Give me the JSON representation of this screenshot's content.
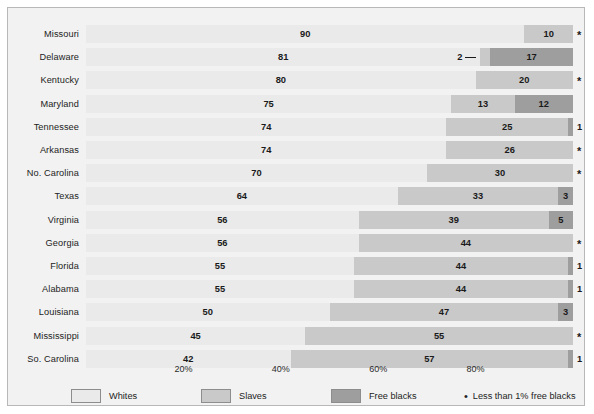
{
  "chart_data": {
    "type": "bar",
    "orientation": "horizontal",
    "stacked": true,
    "title": "",
    "xlabel": "",
    "ylabel": "",
    "xlim": [
      0,
      100
    ],
    "grid": false,
    "legend_position": "bottom",
    "xticks": [
      "20%",
      "40%",
      "60%",
      "80%"
    ],
    "xtick_values": [
      20,
      40,
      60,
      80
    ],
    "categories": [
      "Missouri",
      "Delaware",
      "Kentucky",
      "Maryland",
      "Tennessee",
      "Arkansas",
      "No. Carolina",
      "Texas",
      "Virginia",
      "Georgia",
      "Florida",
      "Alabama",
      "Louisiana",
      "Mississippi",
      "So. Carolina"
    ],
    "series": [
      {
        "name": "Whites",
        "color": "#eaeaea",
        "values": [
          90,
          81,
          80,
          75,
          74,
          74,
          70,
          64,
          56,
          56,
          55,
          55,
          50,
          45,
          42
        ]
      },
      {
        "name": "Slaves",
        "color": "#c9c9c9",
        "values": [
          10,
          2,
          20,
          13,
          25,
          26,
          30,
          33,
          39,
          44,
          44,
          44,
          47,
          55,
          57
        ]
      },
      {
        "name": "Free blacks",
        "color": "#9e9e9e",
        "values": [
          0,
          17,
          0,
          12,
          1,
          0,
          0,
          3,
          5,
          0,
          1,
          1,
          3,
          0,
          1
        ]
      }
    ],
    "rows": [
      {
        "state": "Missouri",
        "whites": 90,
        "slaves": 10,
        "free": 0,
        "whites_label": "90",
        "slaves_label": "10",
        "free_label": "",
        "end_label": "*",
        "end_is_star": true,
        "leader": false
      },
      {
        "state": "Delaware",
        "whites": 81,
        "slaves": 2,
        "free": 17,
        "whites_label": "81",
        "slaves_label": "2",
        "free_label": "17",
        "end_label": "",
        "end_is_star": false,
        "leader": true
      },
      {
        "state": "Kentucky",
        "whites": 80,
        "slaves": 20,
        "free": 0,
        "whites_label": "80",
        "slaves_label": "20",
        "free_label": "",
        "end_label": "*",
        "end_is_star": true,
        "leader": false
      },
      {
        "state": "Maryland",
        "whites": 75,
        "slaves": 13,
        "free": 12,
        "whites_label": "75",
        "slaves_label": "13",
        "free_label": "12",
        "end_label": "",
        "end_is_star": false,
        "leader": false
      },
      {
        "state": "Tennessee",
        "whites": 74,
        "slaves": 25,
        "free": 1,
        "whites_label": "74",
        "slaves_label": "25",
        "free_label": "",
        "end_label": "1",
        "end_is_star": false,
        "leader": false
      },
      {
        "state": "Arkansas",
        "whites": 74,
        "slaves": 26,
        "free": 0,
        "whites_label": "74",
        "slaves_label": "26",
        "free_label": "",
        "end_label": "*",
        "end_is_star": true,
        "leader": false
      },
      {
        "state": "No. Carolina",
        "whites": 70,
        "slaves": 30,
        "free": 0,
        "whites_label": "70",
        "slaves_label": "30",
        "free_label": "",
        "end_label": "*",
        "end_is_star": true,
        "leader": false
      },
      {
        "state": "Texas",
        "whites": 64,
        "slaves": 33,
        "free": 3,
        "whites_label": "64",
        "slaves_label": "33",
        "free_label": "3",
        "end_label": "",
        "end_is_star": false,
        "leader": false
      },
      {
        "state": "Virginia",
        "whites": 56,
        "slaves": 39,
        "free": 5,
        "whites_label": "56",
        "slaves_label": "39",
        "free_label": "5",
        "end_label": "",
        "end_is_star": false,
        "leader": false
      },
      {
        "state": "Georgia",
        "whites": 56,
        "slaves": 44,
        "free": 0,
        "whites_label": "56",
        "slaves_label": "44",
        "free_label": "",
        "end_label": "*",
        "end_is_star": true,
        "leader": false
      },
      {
        "state": "Florida",
        "whites": 55,
        "slaves": 44,
        "free": 1,
        "whites_label": "55",
        "slaves_label": "44",
        "free_label": "",
        "end_label": "1",
        "end_is_star": false,
        "leader": false
      },
      {
        "state": "Alabama",
        "whites": 55,
        "slaves": 44,
        "free": 1,
        "whites_label": "55",
        "slaves_label": "44",
        "free_label": "",
        "end_label": "1",
        "end_is_star": false,
        "leader": false
      },
      {
        "state": "Louisiana",
        "whites": 50,
        "slaves": 47,
        "free": 3,
        "whites_label": "50",
        "slaves_label": "47",
        "free_label": "3",
        "end_label": "",
        "end_is_star": false,
        "leader": false
      },
      {
        "state": "Mississippi",
        "whites": 45,
        "slaves": 55,
        "free": 0,
        "whites_label": "45",
        "slaves_label": "55",
        "free_label": "",
        "end_label": "*",
        "end_is_star": true,
        "leader": false
      },
      {
        "state": "So. Carolina",
        "whites": 42,
        "slaves": 57,
        "free": 1,
        "whites_label": "42",
        "slaves_label": "57",
        "free_label": "",
        "end_label": "1",
        "end_is_star": false,
        "leader": false
      }
    ],
    "legend": [
      {
        "label": "Whites",
        "color": "#eaeaea"
      },
      {
        "label": "Slaves",
        "color": "#c9c9c9"
      },
      {
        "label": "Free blacks",
        "color": "#9e9e9e"
      }
    ],
    "footnote": {
      "marker": "•",
      "text": "Less than 1% free blacks"
    }
  }
}
